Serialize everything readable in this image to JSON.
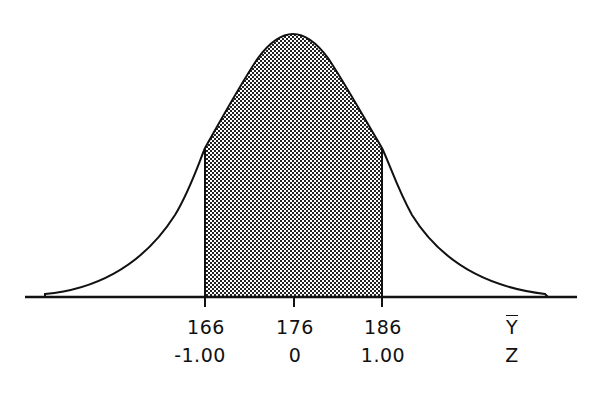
{
  "diagram": {
    "type": "normal-distribution-curve",
    "shaded_region": {
      "from_y": 166,
      "to_y": 186,
      "from_z": "-1.00",
      "to_z": "1.00"
    },
    "mean": 176,
    "colors": {
      "line": "#111111",
      "shade_dark": "#222222",
      "shade_light": "#ffffff",
      "background": "#ffffff"
    }
  },
  "axis": {
    "ticks": [
      {
        "y_value": "166",
        "z_value": "-1.00"
      },
      {
        "y_value": "176",
        "z_value": "0"
      },
      {
        "y_value": "186",
        "z_value": "1.00"
      }
    ],
    "row_labels": {
      "y": "Y",
      "z": "Z"
    }
  }
}
